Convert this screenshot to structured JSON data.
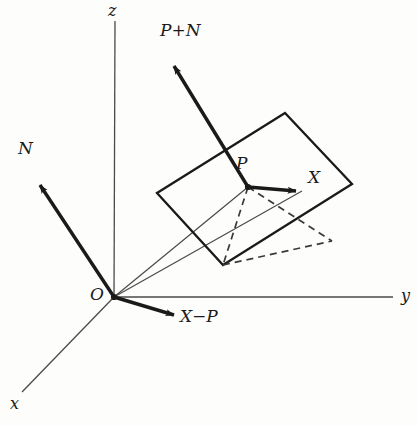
{
  "figure": {
    "kind": "3d-geometry-diagram",
    "colors": {
      "background": "#fdfdfc",
      "ink": "#1a1a1a",
      "thin_line": "#4a4a4a",
      "dashed_line": "#3a3a3a"
    }
  },
  "axes": [
    {
      "name": "x-axis",
      "label": "x",
      "label_x": 10,
      "label_y": 398,
      "from": [
        114,
        297
      ],
      "to": [
        22,
        392
      ],
      "arrow": false
    },
    {
      "name": "y-axis",
      "label": "y",
      "label_x": 401,
      "label_y": 289,
      "from": [
        114,
        297
      ],
      "to": [
        393,
        297
      ],
      "arrow": false
    },
    {
      "name": "z-axis",
      "label": "z",
      "label_x": 108,
      "label_y": 3,
      "from": [
        114,
        297
      ],
      "to": [
        115,
        21
      ],
      "arrow": false
    }
  ],
  "origin": {
    "label": "O",
    "label_x": 92,
    "label_y": 288,
    "point": [
      114,
      297
    ]
  },
  "vectors": [
    {
      "name": "vector-N",
      "label": "N",
      "label_x": 18,
      "label_y": 141,
      "from": [
        114,
        297
      ],
      "to": [
        36,
        179
      ]
    },
    {
      "name": "vector-P-plus-N",
      "label": "P+N",
      "label_x": 160,
      "label_y": 24,
      "from": [
        248,
        187
      ],
      "to": [
        170,
        59
      ]
    },
    {
      "name": "vector-X-minus-P",
      "label": "X−P",
      "label_x": 180,
      "label_y": 310,
      "from": [
        114,
        297
      ],
      "to": [
        180,
        317
      ]
    },
    {
      "name": "vector-P-to-X",
      "label": "X",
      "label_x": 308,
      "label_y": 170,
      "from": [
        248,
        187
      ],
      "to": [
        302,
        191
      ]
    }
  ],
  "points": [
    {
      "name": "point-P",
      "label": "P",
      "label_x": 238,
      "label_y": 150,
      "at": [
        248,
        187
      ]
    }
  ],
  "plane": {
    "name": "tangent-plane",
    "corners": [
      [
        157,
        193
      ],
      [
        285,
        113
      ],
      [
        352,
        184
      ],
      [
        223,
        265
      ]
    ]
  },
  "rays": [
    {
      "name": "ray-origin-to-P",
      "from": [
        114,
        297
      ],
      "to": [
        248,
        187
      ]
    },
    {
      "name": "ray-origin-to-X",
      "from": [
        114,
        297
      ],
      "to": [
        302,
        191
      ]
    }
  ],
  "dashed": [
    {
      "name": "dashed-P-to-bottom-corner",
      "from": [
        248,
        187
      ],
      "to": [
        223,
        265
      ]
    },
    {
      "name": "dashed-P-to-X-foot",
      "from": [
        248,
        187
      ],
      "to": [
        330,
        240
      ]
    },
    {
      "name": "dashed-bottom-to-right",
      "from": [
        223,
        265
      ],
      "to": [
        330,
        240
      ]
    }
  ]
}
